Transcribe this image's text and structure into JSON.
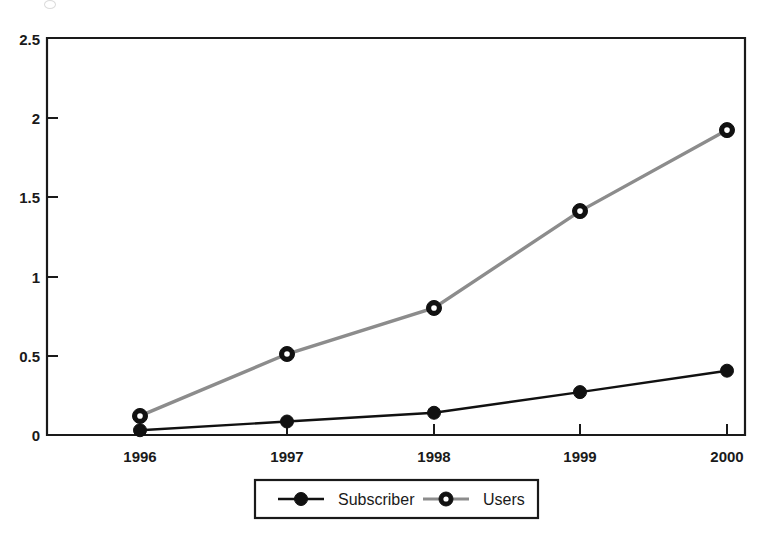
{
  "chart_data": {
    "type": "line",
    "title": "",
    "subtitle": "",
    "xlabel": "",
    "ylabel": "",
    "categories": [
      "1996",
      "1997",
      "1998",
      "1999",
      "2000"
    ],
    "x_tick_labels": [
      "1996",
      "1997",
      "1998",
      "1999",
      "2000"
    ],
    "y_tick_labels": [
      "0",
      "0.5",
      "1",
      "1.5",
      "2",
      "2.5"
    ],
    "y_tick_values": [
      0,
      0.5,
      1,
      1.5,
      2,
      2.5
    ],
    "ylim": [
      0,
      2.5
    ],
    "xlim": [
      "1996",
      "2000"
    ],
    "grid": false,
    "legend_position": "bottom-center",
    "series": [
      {
        "name": "Subscriber",
        "values": [
          0.03,
          0.085,
          0.14,
          0.27,
          0.405
        ],
        "color": "#111111",
        "line_style": "solid",
        "marker": "filled-circle"
      },
      {
        "name": "Users",
        "values": [
          0.12,
          0.51,
          0.8,
          1.41,
          1.92
        ],
        "color": "#8c8c8c",
        "line_style": "solid-gray",
        "marker": "donut-circle"
      }
    ],
    "annotations": []
  },
  "legend": {
    "entries": [
      {
        "label": "Subscriber",
        "marker_name": "legend-marker-subscriber"
      },
      {
        "label": "Users",
        "marker_name": "legend-marker-users"
      }
    ]
  },
  "colors": {
    "axis": "#1a1a1a",
    "background": "#ffffff",
    "subscriber": "#111111",
    "users": "#8c8c8c"
  }
}
